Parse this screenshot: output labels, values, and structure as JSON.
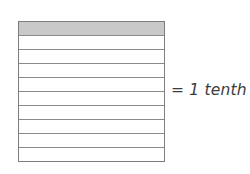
{
  "figure": {
    "name": "tenths-bar-model",
    "total_parts": 10,
    "shaded_parts": 1,
    "fraction": "1/10",
    "rows": [
      {
        "index": 1,
        "shaded": true
      },
      {
        "index": 2,
        "shaded": false
      },
      {
        "index": 3,
        "shaded": false
      },
      {
        "index": 4,
        "shaded": false
      },
      {
        "index": 5,
        "shaded": false
      },
      {
        "index": 6,
        "shaded": false
      },
      {
        "index": 7,
        "shaded": false
      },
      {
        "index": 8,
        "shaded": false
      },
      {
        "index": 9,
        "shaded": false
      },
      {
        "index": 10,
        "shaded": false
      }
    ]
  },
  "legend": {
    "text": "= 1 tenth"
  },
  "colors": {
    "shaded_fill": "#c9c9c9",
    "unshaded_fill": "#ffffff",
    "outline": "#7d7d7d",
    "inner_line": "#8a8a8a",
    "text": "#3c3c3c",
    "background": "#ffffff"
  }
}
